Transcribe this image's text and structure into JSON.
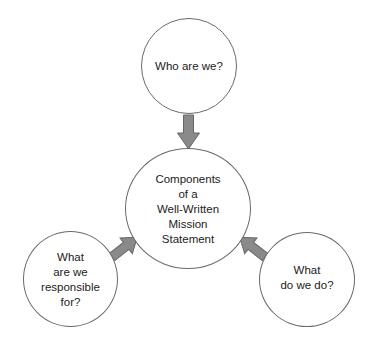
{
  "diagram": {
    "type": "concept-map",
    "colors": {
      "circle_stroke": "#6a6a6a",
      "arrow_fill": "#8a8a8a",
      "arrow_stroke": "#666666",
      "text": "#222222",
      "background": "#ffffff"
    },
    "center_node": {
      "label": "Components\nof a\nWell-Written\nMission\nStatement"
    },
    "satellite_nodes": [
      {
        "id": "top",
        "label": "Who are we?"
      },
      {
        "id": "left",
        "label": "What\nare we\nresponsible\nfor?"
      },
      {
        "id": "right",
        "label": "What\ndo we do?"
      }
    ],
    "edges": [
      {
        "from": "top",
        "to": "center",
        "style": "block-arrow"
      },
      {
        "from": "left",
        "to": "center",
        "style": "block-arrow"
      },
      {
        "from": "right",
        "to": "center",
        "style": "block-arrow"
      }
    ]
  }
}
